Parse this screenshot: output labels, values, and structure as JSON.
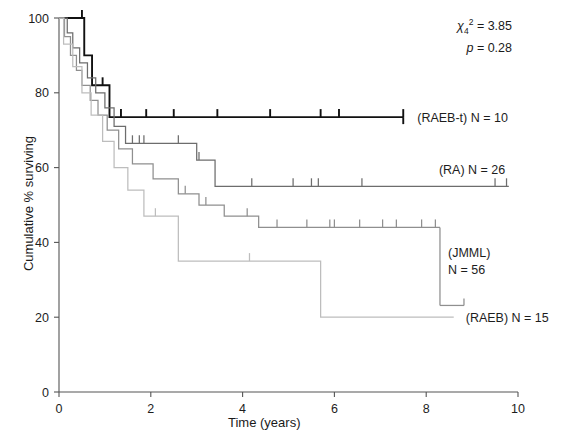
{
  "chart_data": {
    "type": "line",
    "title": "",
    "xlabel": "Time (years)",
    "ylabel": "Cumulative % surviving",
    "xlim": [
      0,
      10
    ],
    "ylim": [
      0,
      100
    ],
    "xticks": [
      "0",
      "2",
      "4",
      "6",
      "8",
      "10"
    ],
    "yticks": [
      "0",
      "20",
      "40",
      "60",
      "80",
      "100"
    ],
    "grid": false,
    "legend_position": "inline-right-of-curve",
    "annotations": {
      "chi_symbol": "χ",
      "chi_sub": "4",
      "chi_sup": "2",
      "chi_eq": "= 3.85",
      "p_symbol": "p",
      "p_eq": "= 0.28"
    },
    "series": [
      {
        "name": "RAEB-t",
        "label": "(RAEB-t) N = 10",
        "n": 10,
        "color": "#111111",
        "plateau_value": 73.5,
        "last_time": 7.5,
        "steps": [
          [
            0,
            100
          ],
          [
            0.55,
            100
          ],
          [
            0.55,
            90
          ],
          [
            0.72,
            90
          ],
          [
            0.72,
            82
          ],
          [
            1.1,
            82
          ],
          [
            1.1,
            73.5
          ],
          [
            7.5,
            73.5
          ]
        ],
        "censor_times": [
          0.5,
          0.95,
          1.35,
          1.9,
          2.5,
          3.45,
          4.6,
          5.7,
          6.1,
          7.5
        ]
      },
      {
        "name": "RA",
        "label": "(RA) N = 26",
        "n": 26,
        "color": "#6d6d6d",
        "plateau_value": 55,
        "last_time": 9.8,
        "steps": [
          [
            0,
            100
          ],
          [
            0.18,
            100
          ],
          [
            0.18,
            96
          ],
          [
            0.3,
            96
          ],
          [
            0.3,
            92
          ],
          [
            0.45,
            92
          ],
          [
            0.45,
            88
          ],
          [
            0.62,
            88
          ],
          [
            0.62,
            84
          ],
          [
            0.8,
            84
          ],
          [
            0.8,
            80
          ],
          [
            1.0,
            80
          ],
          [
            1.0,
            76
          ],
          [
            1.2,
            76
          ],
          [
            1.2,
            71
          ],
          [
            1.45,
            71
          ],
          [
            1.45,
            66.5
          ],
          [
            3.0,
            66.5
          ],
          [
            3.0,
            62
          ],
          [
            3.4,
            62
          ],
          [
            3.4,
            55
          ],
          [
            9.8,
            55
          ]
        ],
        "censor_times": [
          1.6,
          1.75,
          1.85,
          2.6,
          3.05,
          4.2,
          5.1,
          5.5,
          5.65,
          6.6,
          9.5,
          9.75
        ]
      },
      {
        "name": "JMML",
        "label": "(JMML) N = 56",
        "label_line1": "(JMML)",
        "label_line2": "N = 56",
        "n": 56,
        "color": "#8f8f8f",
        "plateau_value": 44,
        "last_time": 8.3,
        "steps": [
          [
            0,
            100
          ],
          [
            0.12,
            100
          ],
          [
            0.12,
            95
          ],
          [
            0.25,
            95
          ],
          [
            0.25,
            90
          ],
          [
            0.38,
            90
          ],
          [
            0.38,
            86
          ],
          [
            0.5,
            86
          ],
          [
            0.5,
            82
          ],
          [
            0.68,
            82
          ],
          [
            0.68,
            78
          ],
          [
            0.85,
            78
          ],
          [
            0.85,
            74
          ],
          [
            1.05,
            74
          ],
          [
            1.05,
            70
          ],
          [
            1.3,
            70
          ],
          [
            1.3,
            65
          ],
          [
            1.6,
            65
          ],
          [
            1.6,
            61
          ],
          [
            2.05,
            61
          ],
          [
            2.05,
            57
          ],
          [
            2.6,
            57
          ],
          [
            2.6,
            53
          ],
          [
            3.05,
            53
          ],
          [
            3.05,
            50
          ],
          [
            3.6,
            50
          ],
          [
            3.6,
            47
          ],
          [
            4.35,
            47
          ],
          [
            4.35,
            44
          ],
          [
            8.3,
            44
          ]
        ],
        "censor_times": [
          2.75,
          3.2,
          4.1,
          4.75,
          5.4,
          5.9,
          6.0,
          6.55,
          7.05,
          7.35,
          7.9,
          8.2
        ]
      },
      {
        "name": "RAEB",
        "label": "(RAEB) N = 15",
        "n": 15,
        "color": "#bdbdbd",
        "plateau_value": 20,
        "last_time": 8.6,
        "steps": [
          [
            0,
            100
          ],
          [
            0.1,
            100
          ],
          [
            0.1,
            93
          ],
          [
            0.3,
            93
          ],
          [
            0.3,
            87
          ],
          [
            0.5,
            87
          ],
          [
            0.5,
            80
          ],
          [
            0.7,
            80
          ],
          [
            0.7,
            74
          ],
          [
            0.95,
            74
          ],
          [
            0.95,
            67
          ],
          [
            1.2,
            67
          ],
          [
            1.2,
            60
          ],
          [
            1.5,
            60
          ],
          [
            1.5,
            54
          ],
          [
            1.85,
            54
          ],
          [
            1.85,
            47
          ],
          [
            2.6,
            47
          ],
          [
            2.6,
            35
          ],
          [
            5.7,
            35
          ],
          [
            5.7,
            20
          ],
          [
            8.6,
            20
          ]
        ],
        "censor_times": [
          2.1,
          4.15
        ]
      }
    ]
  }
}
